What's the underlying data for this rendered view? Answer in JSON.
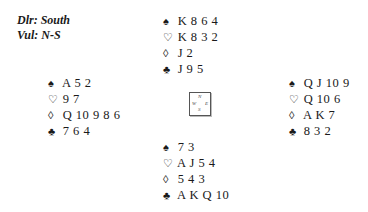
{
  "deal_info": {
    "dealer": "Dlr: South",
    "vulnerability": "Vul: N-S"
  },
  "suit_symbols": {
    "spades": "♠",
    "hearts": "♡",
    "diamonds": "◊",
    "clubs": "♣"
  },
  "hands": {
    "north": {
      "spades": "K 8 6 4",
      "hearts": "K 8 3 2",
      "diamonds": "J 2",
      "clubs": "J 9 5"
    },
    "west": {
      "spades": "A 5 2",
      "hearts": "9 7",
      "diamonds": "Q 10 9 8 6",
      "clubs": "7 6 4"
    },
    "east": {
      "spades": "Q J 10 9",
      "hearts": "Q 10 6",
      "diamonds": "A K 7",
      "clubs": "8 3 2"
    },
    "south": {
      "spades": "7 3",
      "hearts": "A J 5 4",
      "diamonds": "5 4 3",
      "clubs": "A K Q 10"
    }
  },
  "compass": {
    "n": "N",
    "w": "W",
    "e": "E",
    "s": "S"
  }
}
